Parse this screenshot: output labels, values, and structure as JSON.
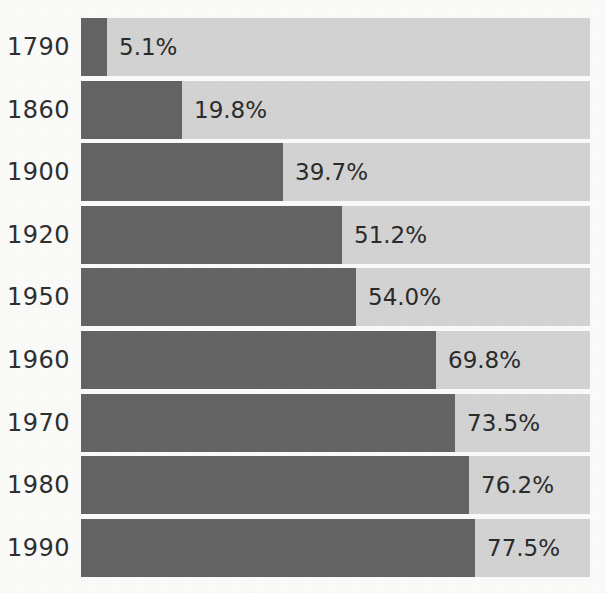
{
  "chart_data": {
    "type": "bar",
    "orientation": "horizontal",
    "stacked": true,
    "title": "",
    "subtitle": "",
    "xlabel": "",
    "ylabel": "",
    "xlim": [
      0,
      100
    ],
    "grid": false,
    "legend": "none",
    "value_suffix": "%",
    "categories": [
      "1790",
      "1860",
      "1900",
      "1920",
      "1950",
      "1960",
      "1970",
      "1980",
      "1990"
    ],
    "values": [
      5.1,
      19.8,
      39.7,
      51.2,
      54.0,
      69.8,
      73.5,
      76.2,
      77.5
    ],
    "data_labels": [
      "5.1%",
      "19.8%",
      "39.7%",
      "51.2%",
      "54.0%",
      "69.8%",
      "73.5%",
      "76.2%",
      "77.5%"
    ],
    "series": [
      {
        "name": "filled",
        "color": "#646464",
        "values": [
          5.1,
          19.8,
          39.7,
          51.2,
          54.0,
          69.8,
          73.5,
          76.2,
          77.5
        ]
      },
      {
        "name": "remainder",
        "color": "#d3d3d3",
        "values": [
          94.9,
          80.2,
          60.3,
          48.8,
          46.0,
          30.2,
          26.5,
          23.8,
          22.5
        ]
      }
    ],
    "rows": [
      {
        "category": "1790",
        "value": 5.1,
        "label": "5.1%"
      },
      {
        "category": "1860",
        "value": 19.8,
        "label": "19.8%"
      },
      {
        "category": "1900",
        "value": 39.7,
        "label": "39.7%"
      },
      {
        "category": "1920",
        "value": 51.2,
        "label": "51.2%"
      },
      {
        "category": "1950",
        "value": 54.0,
        "label": "54.0%"
      },
      {
        "category": "1960",
        "value": 69.8,
        "label": "69.8%"
      },
      {
        "category": "1970",
        "value": 73.5,
        "label": "73.5%"
      },
      {
        "category": "1980",
        "value": 76.2,
        "label": "76.2%"
      },
      {
        "category": "1990",
        "value": 77.5,
        "label": "77.5%"
      }
    ],
    "colors": {
      "background": "#fbfbfa",
      "bar_filled": "#646464",
      "bar_remainder": "#d3d3d3",
      "label_text": "#2f2f2f",
      "value_text": "#2b2b2b"
    }
  }
}
